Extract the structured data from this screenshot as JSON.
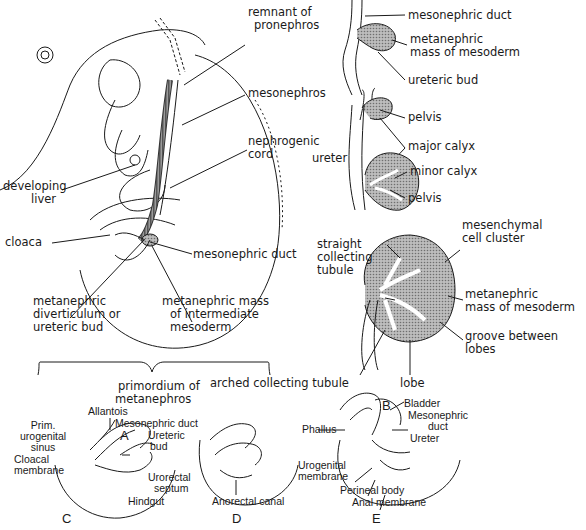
{
  "panels": {
    "A": {
      "letter": "A",
      "labels": {
        "remnant": "remnant of",
        "remnant2": "pronephros",
        "mesonephros": "mesonephros",
        "developing_liver": "developing",
        "developing_liver2": "liver",
        "nephrogenic": "nephrogenic",
        "nephrogenic2": "cord",
        "cloaca": "cloaca",
        "mesonephric_duct": "mesonephric duct",
        "metanephric_div": "metanephric",
        "metanephric_div2": "diverticulum or",
        "metanephric_div3": "ureteric bud",
        "metanephric_mass": "metanephric mass",
        "metanephric_mass2": "of intermediate",
        "metanephric_mass3": "mesoderm",
        "primordium": "primordium of",
        "primordium2": "metanephros"
      }
    },
    "B": {
      "letter": "B",
      "labels": {
        "mesonephric_duct": "mesonephric duct",
        "metanephric_mass": "metanephric",
        "metanephric_mass2": "mass of mesoderm",
        "ureteric_bud": "ureteric bud",
        "pelvis1": "pelvis",
        "major_calyx": "major calyx",
        "ureter": "ureter",
        "minor_calyx": "minor calyx",
        "pelvis2": "pelvis",
        "mesenchymal": "mesenchymal",
        "mesenchymal2": "cell cluster",
        "straight": "straight",
        "straight2": "collecting",
        "straight3": "tubule",
        "metanephric_mass_b": "metanephric",
        "metanephric_mass_b2": "mass of mesoderm",
        "groove": "groove between",
        "groove2": "lobes",
        "arched": "arched collecting tubule",
        "lobe": "lobe"
      }
    },
    "C": {
      "letter": "C",
      "labels": {
        "allantois": "Allantois",
        "mesonephric_duct": "Mesonephric duct",
        "prim": "Prim.",
        "prim2": "urogenital",
        "prim3": "sinus",
        "ureteric": "Ureteric",
        "ureteric2": "bud",
        "cloacal": "Cloacal",
        "cloacal2": "membrane",
        "urorectal": "Urorectal",
        "urorectal2": "septum",
        "hindgut": "Hindgut"
      }
    },
    "D": {
      "letter": "D",
      "labels": {
        "anorectal": "Anorectal canal"
      }
    },
    "E": {
      "letter": "E",
      "labels": {
        "bladder": "Bladder",
        "mesonephric": "Mesonephric",
        "mesonephric2": "duct",
        "phallus": "Phallus",
        "ureter": "Ureter",
        "urogenital": "Urogenital",
        "urogenital2": "membrane",
        "perineal": "Perineal body",
        "anal": "Anal membrane"
      }
    }
  },
  "colors": {
    "ink": "#1a1a1a",
    "shade": "#8a8a8a",
    "light": "#d8d8d8"
  }
}
